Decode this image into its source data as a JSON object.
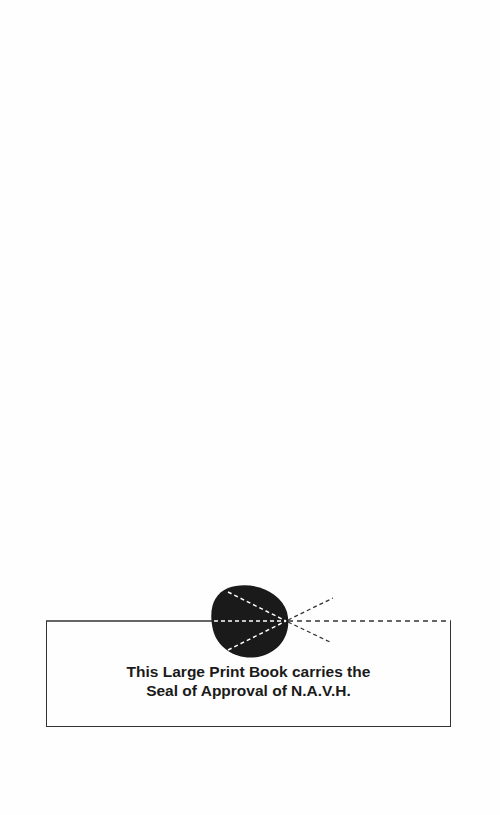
{
  "notice": {
    "line1": "This Large Print Book carries the",
    "line2": "Seal of Approval of N.A.V.H."
  },
  "seal": {
    "icon": "eye-seal-icon",
    "fill_color": "#1a1a1a",
    "line_color": "#333333"
  }
}
